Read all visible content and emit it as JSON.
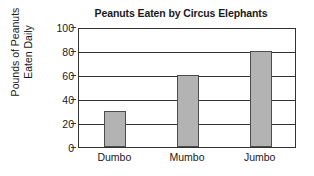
{
  "chart_data": {
    "type": "bar",
    "title": "Peanuts Eaten by Circus Elephants",
    "xlabel": "",
    "ylabel": "Pounds of Peanuts Eaten Daily",
    "ylabel_lines": [
      "Pounds of Peanuts",
      "Eaten Daily"
    ],
    "categories": [
      "Dumbo",
      "Mumbo",
      "Jumbo"
    ],
    "values": [
      30,
      60,
      80
    ],
    "ylim": [
      0,
      100
    ],
    "yticks": [
      0,
      20,
      40,
      60,
      80,
      100
    ],
    "ytick_labels": [
      "0",
      "20",
      "40",
      "60",
      "80",
      "100"
    ],
    "grid": true,
    "grid_axis": "y",
    "legend": false,
    "bar_color": "#b3b3b3",
    "bar_edge_color": "#4d4d4d",
    "axis_color": "#333333",
    "background_color": "#ffffff"
  }
}
